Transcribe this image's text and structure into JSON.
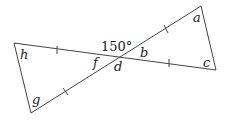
{
  "diagram": {
    "type": "two triangles sharing a vertex (vertical angles)",
    "given_angle": "150°",
    "labels": {
      "a": "a",
      "b": "b",
      "c": "c",
      "d": "d",
      "f": "f",
      "g": "g",
      "h": "h"
    },
    "tick_marks": "single ticks on the four segments from the intersection, indicating equal lengths",
    "colors": {
      "line": "#444444",
      "text": "#222222",
      "background": "#ffffff"
    }
  }
}
